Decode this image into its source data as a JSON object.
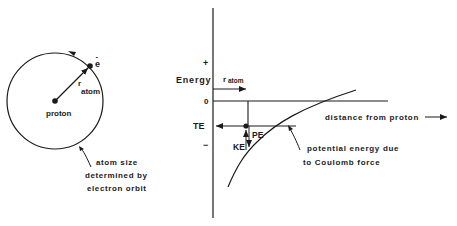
{
  "figure": {
    "left_panel": {
      "nucleus_label": "proton",
      "electron_label": "e",
      "electron_bar": "-",
      "radius_label_main": "r",
      "radius_label_sub": "atom",
      "caption_lines": [
        "atom size",
        "determined by",
        "electron orbit"
      ]
    },
    "right_panel": {
      "y_axis_label": "Energy",
      "plus_sign": "+",
      "minus_sign": "−",
      "zero_tick": "0",
      "r_atom_main": "r",
      "r_atom_sub": "atom",
      "te_label": "TE",
      "pe_label": "PE",
      "ke_label": "KE",
      "x_axis_label": "distance from proton",
      "curve_caption_lines": [
        "potential energy due",
        "to Coulomb force"
      ]
    },
    "colors": {
      "ink": "#1a1a1a",
      "background": "#ffffff"
    }
  }
}
